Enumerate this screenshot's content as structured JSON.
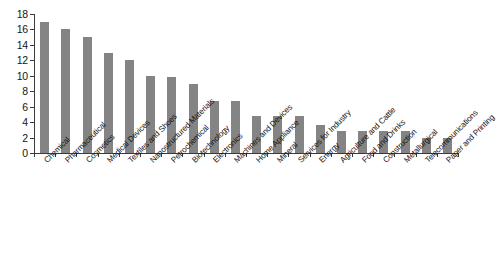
{
  "chart_data": {
    "type": "bar",
    "title": "",
    "xlabel": "",
    "ylabel": "",
    "ylim": [
      0,
      18
    ],
    "ytick_step": 2,
    "yticks": [
      "0",
      "2",
      "4",
      "6",
      "8",
      "10",
      "12",
      "14",
      "16",
      "18"
    ],
    "grid": false,
    "legend": "none",
    "bar_color": "#848484",
    "axis_color": "#3a3a3a",
    "background": "#ffffff",
    "categories": [
      "Chemical",
      "Pharmaceutical",
      "Cosmetics",
      "Medical Devices",
      "Textiles and Shoes",
      "Nanostructured Materials",
      "Petrochemical",
      "Biotechnology",
      "Electronics",
      "Machines and Devices",
      "Home Appliance",
      "Mineral",
      "Services for Industry",
      "Energy",
      "Agriculture and Cattle",
      "Food and Drinks",
      "Construction",
      "Metallurgical",
      "Telecommunications",
      "Paper and Printing"
    ],
    "values": [
      17.0,
      16.0,
      15.0,
      13.0,
      12.0,
      10.0,
      9.9,
      9.0,
      6.8,
      6.8,
      4.8,
      4.8,
      4.8,
      3.6,
      2.8,
      2.8,
      2.8,
      2.8,
      1.9,
      1.9
    ]
  }
}
